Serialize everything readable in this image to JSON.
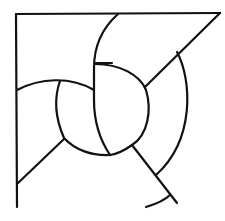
{
  "diagram": {
    "type": "line-art geometric figure",
    "stroke_color": "#111111",
    "background_color": "#ffffff",
    "elements": [
      {
        "id": "frame-left",
        "kind": "line"
      },
      {
        "id": "frame-top",
        "kind": "line"
      },
      {
        "id": "diagonal-top-right",
        "kind": "line"
      },
      {
        "id": "outer-arc-right",
        "kind": "arc"
      },
      {
        "id": "tall-arc-left",
        "kind": "arc"
      },
      {
        "id": "inner-circle-right",
        "kind": "arc"
      },
      {
        "id": "inner-circle-left",
        "kind": "arc"
      },
      {
        "id": "arc-upper-left",
        "kind": "arc"
      },
      {
        "id": "diagonal-lower-left",
        "kind": "line"
      },
      {
        "id": "diagonal-lower-right",
        "kind": "line"
      },
      {
        "id": "small-arc-bottom",
        "kind": "arc"
      }
    ]
  }
}
